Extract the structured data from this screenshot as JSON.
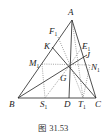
{
  "figure": {
    "caption": "图 31.53",
    "colors": {
      "solid": "#222222",
      "dotted": "#666666",
      "text": "#1a1a1a"
    },
    "points": {
      "A": {
        "label": "A",
        "sub": "",
        "x": 72,
        "y": 20,
        "lx": 68,
        "ly": 15
      },
      "B": {
        "label": "B",
        "sub": "",
        "x": 18,
        "y": 98,
        "lx": 9,
        "ly": 107
      },
      "C": {
        "label": "C",
        "sub": "",
        "x": 96,
        "y": 98,
        "lx": 95,
        "ly": 107
      },
      "D": {
        "label": "D",
        "sub": "",
        "x": 69,
        "y": 98,
        "lx": 64,
        "ly": 107
      },
      "S1": {
        "label": "S",
        "sub": "1",
        "x": 45,
        "y": 98,
        "lx": 40,
        "ly": 107
      },
      "T1": {
        "label": "T",
        "sub": "1",
        "x": 83,
        "y": 98,
        "lx": 78,
        "ly": 107
      },
      "G": {
        "label": "G",
        "sub": "",
        "x": 70,
        "y": 65,
        "lx": 60,
        "ly": 81
      },
      "K": {
        "label": "K",
        "sub": "",
        "x": 52,
        "y": 47,
        "lx": 44,
        "ly": 49
      },
      "F1": {
        "label": "F",
        "sub": "1",
        "x": 58,
        "y": 37,
        "lx": 49,
        "ly": 34
      },
      "M1": {
        "label": "M",
        "sub": "1",
        "x": 42,
        "y": 64,
        "lx": 29,
        "ly": 66
      },
      "E1": {
        "label": "E",
        "sub": "1",
        "x": 82,
        "y": 47,
        "lx": 82,
        "ly": 49
      },
      "J": {
        "label": "J",
        "sub": "",
        "x": 87,
        "y": 55,
        "lx": 86,
        "ly": 58
      },
      "N1": {
        "label": "N",
        "sub": "1",
        "x": 90,
        "y": 65,
        "lx": 91,
        "ly": 70
      }
    },
    "solid_segments": [
      [
        "A",
        "B"
      ],
      [
        "A",
        "C"
      ],
      [
        "B",
        "C"
      ],
      [
        "A",
        "D"
      ],
      [
        "K",
        "C"
      ],
      [
        "B",
        "J"
      ]
    ],
    "dotted_segments": [
      [
        "M1",
        "N1"
      ],
      [
        "M1",
        "S1"
      ],
      [
        "G",
        "S1"
      ],
      [
        "G",
        "T1"
      ],
      [
        "A",
        "T1"
      ],
      [
        "F1",
        "G"
      ],
      [
        "G",
        "E1"
      ],
      [
        "N1",
        "T1"
      ]
    ]
  }
}
